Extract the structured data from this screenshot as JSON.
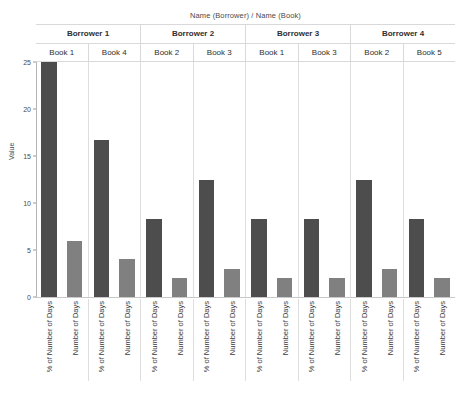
{
  "chart_data": {
    "type": "bar",
    "title": "Name (Borrower) / Name (Book)",
    "xlabel": "",
    "ylabel": "Value",
    "ylim": [
      0,
      25
    ],
    "yticks": [
      0,
      5,
      10,
      15,
      20,
      25
    ],
    "ytick_labels": [
      "0",
      "5",
      "10",
      "15",
      "20",
      "25"
    ],
    "grid": false,
    "legend": "none",
    "group_header_top": "Name (Borrower)",
    "group_header_bottom": "Name (Book)",
    "measures": [
      "% of Number of Days",
      "Number of Days"
    ],
    "colors": {
      "pct_of_number_of_days": "#4d4d4d",
      "number_of_days": "#808080",
      "panel_border": "#dedede",
      "axis": "#b5b5b5",
      "text": "#333333"
    },
    "borrowers": [
      {
        "label": "Borrower 1",
        "books": [
          {
            "label": "Book 1",
            "bars": [
              {
                "measure": "% of Number of Days",
                "value": 25.0
              },
              {
                "measure": "Number of Days",
                "value": 6.0
              }
            ]
          },
          {
            "label": "Book 4",
            "bars": [
              {
                "measure": "% of Number of Days",
                "value": 16.7
              },
              {
                "measure": "Number of Days",
                "value": 4.0
              }
            ]
          }
        ]
      },
      {
        "label": "Borrower 2",
        "books": [
          {
            "label": "Book 2",
            "bars": [
              {
                "measure": "% of Number of Days",
                "value": 8.3
              },
              {
                "measure": "Number of Days",
                "value": 2.0
              }
            ]
          },
          {
            "label": "Book 3",
            "bars": [
              {
                "measure": "% of Number of Days",
                "value": 12.5
              },
              {
                "measure": "Number of Days",
                "value": 3.0
              }
            ]
          }
        ]
      },
      {
        "label": "Borrower 3",
        "books": [
          {
            "label": "Book 1",
            "bars": [
              {
                "measure": "% of Number of Days",
                "value": 8.3
              },
              {
                "measure": "Number of Days",
                "value": 2.0
              }
            ]
          },
          {
            "label": "Book 3",
            "bars": [
              {
                "measure": "% of Number of Days",
                "value": 8.3
              },
              {
                "measure": "Number of Days",
                "value": 2.0
              }
            ]
          }
        ]
      },
      {
        "label": "Borrower 4",
        "books": [
          {
            "label": "Book 2",
            "bars": [
              {
                "measure": "% of Number of Days",
                "value": 12.5
              },
              {
                "measure": "Number of Days",
                "value": 3.0
              }
            ]
          },
          {
            "label": "Book 5",
            "bars": [
              {
                "measure": "% of Number of Days",
                "value": 8.3
              },
              {
                "measure": "Number of Days",
                "value": 2.0
              }
            ]
          }
        ]
      }
    ]
  }
}
